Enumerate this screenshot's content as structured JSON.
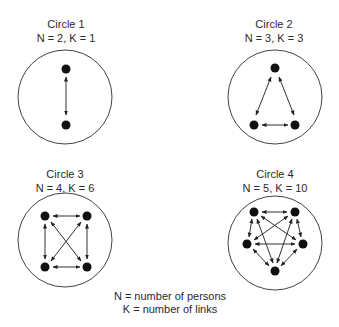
{
  "diagrams": [
    {
      "title": "Circle 1",
      "subtitle": "N = 2, K = 1",
      "persons": 2,
      "links": 1
    },
    {
      "title": "Circle 2",
      "subtitle": "N = 3, K = 3",
      "persons": 3,
      "links": 3
    },
    {
      "title": "Circle 3",
      "subtitle": "N = 4, K = 6",
      "persons": 4,
      "links": 6
    },
    {
      "title": "Circle 4",
      "subtitle": "N = 5, K = 10",
      "persons": 5,
      "links": 10
    }
  ],
  "legend": {
    "line1": "N = number of persons",
    "line2": "K = number of links"
  },
  "colors": {
    "node": "#111111",
    "line": "#333333",
    "circle": "#444444",
    "text": "#2a2a2a"
  }
}
